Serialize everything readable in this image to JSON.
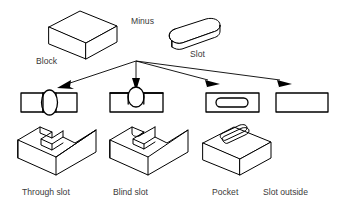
{
  "diagram": {
    "background_color": "#ffffff",
    "line_color": "#000000",
    "label_color": "#3a3a3a",
    "operands": {
      "block": {
        "label": "Block",
        "icon": "isometric-block-icon"
      },
      "operator": {
        "label": "Minus",
        "symbol": "minus"
      },
      "slot": {
        "label": "Slot",
        "icon": "isometric-rounded-prism-icon"
      }
    },
    "results": [
      {
        "id": "through-slot",
        "label": "Through slot",
        "topview_icon": "rect-with-full-ellipse-icon",
        "solid_icon": "block-with-through-channel-icon"
      },
      {
        "id": "blind-slot",
        "label": "Blind slot",
        "topview_icon": "rect-with-edge-ellipse-icon",
        "solid_icon": "block-with-blind-channel-icon"
      },
      {
        "id": "pocket",
        "label": "Pocket",
        "topview_icon": "rect-with-inner-stadium-icon",
        "solid_icon": "block-with-stadium-pocket-icon"
      },
      {
        "id": "slot-outside",
        "label": "Slot outside",
        "topview_icon": "plain-rect-icon",
        "solid_icon": "none"
      }
    ],
    "arrows": {
      "count": 4,
      "origin_label": "branch-node",
      "targets": [
        "through-slot",
        "blind-slot",
        "pocket",
        "slot-outside"
      ]
    }
  }
}
